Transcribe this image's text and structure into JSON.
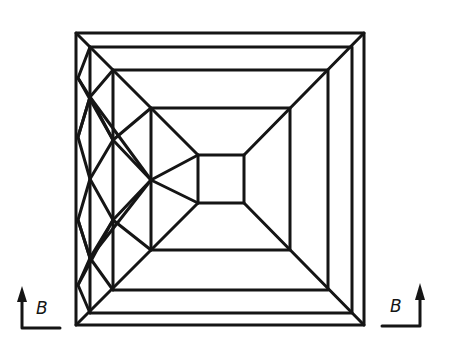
{
  "figure": {
    "type": "line-drawing",
    "stroke_color": "#151515",
    "background": "#ffffff"
  },
  "labels": {
    "left_field": "B",
    "right_field": "B"
  },
  "rects": [
    {
      "x1": 76,
      "y1": 33,
      "x2": 364,
      "y2": 325
    },
    {
      "x1": 90,
      "y1": 47,
      "x2": 352,
      "y2": 313
    },
    {
      "x1": 113,
      "y1": 70,
      "x2": 328,
      "y2": 290
    },
    {
      "x1": 151,
      "y1": 108,
      "x2": 290,
      "y2": 250
    },
    {
      "x1": 198,
      "y1": 155,
      "x2": 244,
      "y2": 203
    }
  ]
}
